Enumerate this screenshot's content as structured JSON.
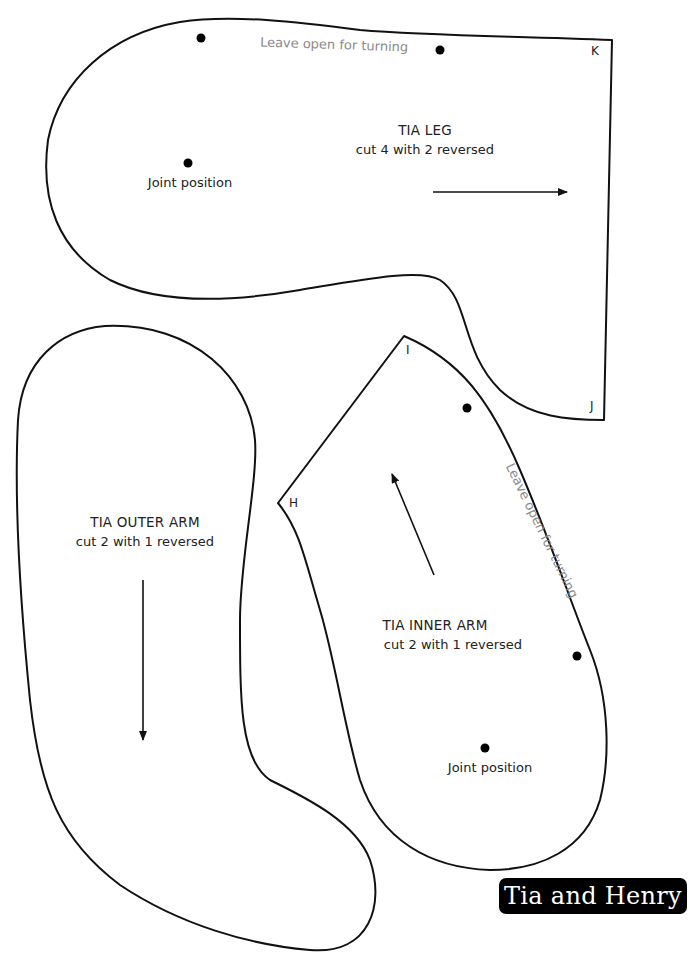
{
  "pieces": {
    "leg": {
      "title": "TIA LEG",
      "instruction": "cut 4 with 2 reversed",
      "joint_label": "Joint position",
      "opening_note": "Leave open for turning",
      "corners": [
        "K",
        "J"
      ],
      "grainline_direction": "right"
    },
    "outer_arm": {
      "title": "TIA OUTER ARM",
      "instruction": "cut 2 with 1 reversed",
      "grainline_direction": "down"
    },
    "inner_arm": {
      "title": "TIA INNER ARM",
      "instruction": "cut 2 with 1 reversed",
      "joint_label": "Joint position",
      "opening_note": "Leave open for turning",
      "corners": [
        "I",
        "H"
      ],
      "grainline_direction": "up-left"
    }
  },
  "brand": {
    "label": "Tia and Henry",
    "bg_color": "#000000",
    "text_color": "#ffffff"
  }
}
